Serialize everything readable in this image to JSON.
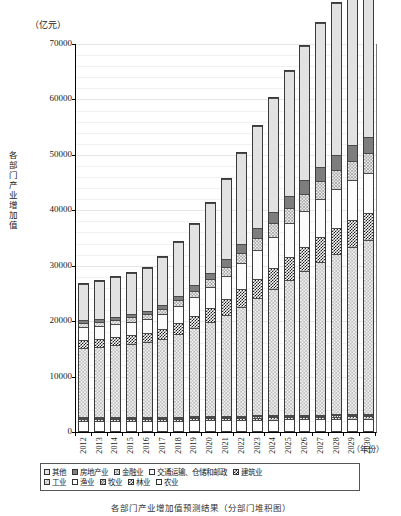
{
  "axis": {
    "unit_label": "（亿元）",
    "y_title_chars": [
      "各",
      "部",
      "门",
      "产",
      "业",
      "增",
      "加",
      "值"
    ],
    "y_title": "各部门产业增加值",
    "x_unit_label": "（年份）",
    "y_ticks": [
      "0",
      "10000",
      "20000",
      "30000",
      "40000",
      "50000",
      "60000",
      "70000"
    ]
  },
  "legend": {
    "row1": [
      {
        "label": "其他",
        "key": "qita",
        "color": "#e2e2e2"
      },
      {
        "label": "房地产业",
        "key": "fangdi",
        "color": "#7d7d7d"
      },
      {
        "label": "金融业",
        "key": "jinrong",
        "color": "#cfcfcf"
      },
      {
        "label": "交通运输、仓储和邮政",
        "key": "jiaotong",
        "color": "#fbfbfb"
      },
      {
        "label": "建筑业",
        "key": "jianzhu",
        "color": "#4a4a4a"
      }
    ],
    "row2": [
      {
        "label": "工业",
        "key": "gongye",
        "color": "#dcdcdc"
      },
      {
        "label": "渔业",
        "key": "yuye",
        "color": "#ffffff"
      },
      {
        "label": "牧业",
        "key": "muye",
        "color": "#555555"
      },
      {
        "label": "林业",
        "key": "linye",
        "color": "#6a6a6a"
      },
      {
        "label": "农业",
        "key": "nongye",
        "color": "#ffffff"
      }
    ]
  },
  "caption": "各部门产业增加值预测结果（分部门堆积图）",
  "chart_data": {
    "type": "bar",
    "title": "",
    "subtitle": "",
    "xlabel": "（年份）",
    "ylabel": "各部门产业增加值",
    "yunit": "（亿元）",
    "ylim": [
      0,
      70000
    ],
    "ytick_step": 10000,
    "grid": true,
    "stacked": true,
    "legend_position": "bottom",
    "categories": [
      "2012",
      "2013",
      "2014",
      "2015",
      "2016",
      "2017",
      "2018",
      "2019",
      "2020",
      "2021",
      "2022",
      "2023",
      "2024",
      "2025",
      "2026",
      "2027",
      "2028",
      "2029",
      "2030"
    ],
    "series": [
      {
        "name": "农业",
        "values": [
          1750,
          1760,
          1780,
          1800,
          1820,
          1850,
          1880,
          1900,
          1930,
          1960,
          1990,
          2020,
          2050,
          2080,
          2110,
          2140,
          2170,
          2200,
          2230
        ]
      },
      {
        "name": "林业",
        "values": [
          330,
          335,
          340,
          345,
          350,
          355,
          360,
          365,
          375,
          380,
          390,
          395,
          405,
          410,
          420,
          425,
          435,
          440,
          450
        ]
      },
      {
        "name": "牧业",
        "values": [
          180,
          182,
          185,
          188,
          190,
          193,
          196,
          199,
          202,
          205,
          208,
          211,
          214,
          217,
          220,
          223,
          226,
          229,
          232
        ]
      },
      {
        "name": "渔业",
        "values": [
          150,
          152,
          154,
          156,
          158,
          160,
          162,
          164,
          166,
          168,
          170,
          172,
          174,
          176,
          178,
          180,
          182,
          184,
          186
        ]
      },
      {
        "name": "工业",
        "values": [
          12600,
          12750,
          12950,
          13200,
          13500,
          14100,
          14900,
          15900,
          17000,
          18300,
          19700,
          21200,
          22800,
          24400,
          26000,
          27500,
          28900,
          30200,
          31400
        ]
      },
      {
        "name": "建筑业",
        "values": [
          1450,
          1480,
          1520,
          1560,
          1620,
          1750,
          1950,
          2180,
          2450,
          2750,
          3080,
          3420,
          3760,
          4080,
          4360,
          4580,
          4740,
          4850,
          4900
        ]
      },
      {
        "name": "交通运输、仓储和邮政",
        "values": [
          2250,
          2300,
          2380,
          2460,
          2560,
          2760,
          3040,
          3380,
          3780,
          4220,
          4700,
          5180,
          5660,
          6100,
          6480,
          6780,
          6980,
          7100,
          7150
        ]
      },
      {
        "name": "金融业",
        "values": [
          700,
          720,
          750,
          780,
          820,
          920,
          1060,
          1240,
          1450,
          1690,
          1960,
          2240,
          2530,
          2810,
          3070,
          3290,
          3460,
          3580,
          3650
        ]
      },
      {
        "name": "房地产业",
        "values": [
          520,
          535,
          555,
          575,
          605,
          680,
          790,
          930,
          1100,
          1290,
          1500,
          1720,
          1950,
          2170,
          2380,
          2560,
          2700,
          2800,
          2860
        ]
      },
      {
        "name": "其他",
        "values": [
          6570,
          6790,
          7090,
          7410,
          7780,
          8630,
          9760,
          11140,
          12750,
          14540,
          16470,
          18470,
          20500,
          22480,
          24340,
          26010,
          27430,
          28560,
          29360
        ]
      }
    ]
  }
}
